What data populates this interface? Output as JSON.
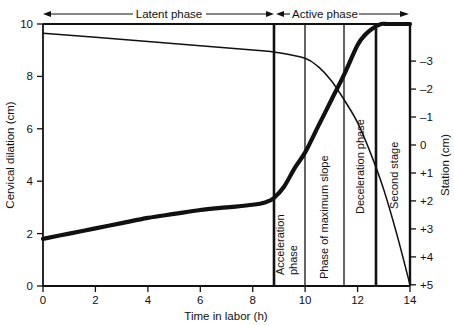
{
  "chart_data": {
    "type": "line",
    "title": "",
    "xlabel": "Time in labor (h)",
    "ylabel": "Cervical dilation (cm)",
    "y2label": "Station (cm)",
    "xlim": [
      0,
      14
    ],
    "ylim": [
      0,
      10
    ],
    "y2lim": [
      -4,
      5
    ],
    "grid": false,
    "legend_position": "none",
    "xticks": [
      "0",
      "2",
      "4",
      "6",
      "8",
      "10",
      "12",
      "14"
    ],
    "xtick_values": [
      0,
      2,
      4,
      6,
      8,
      10,
      12,
      14
    ],
    "yticks": [
      "0",
      "2",
      "4",
      "6",
      "8",
      "10"
    ],
    "ytick_values": [
      0,
      2,
      4,
      6,
      8,
      10
    ],
    "y2ticks": [
      "–3",
      "–2",
      "–1",
      "0",
      "+1",
      "+2",
      "+3",
      "+4",
      "+5"
    ],
    "y2tick_values": [
      -3,
      -2,
      -1,
      0,
      1,
      2,
      3,
      4,
      5
    ],
    "series": [
      {
        "name": "Cervical dilation",
        "axis": "left",
        "style": "thick",
        "x": [
          0,
          1,
          2,
          3,
          4,
          5,
          6,
          7,
          8,
          8.5,
          8.8,
          9.2,
          9.6,
          10,
          10.5,
          11,
          11.5,
          12,
          12.3,
          12.6,
          12.9,
          13.2,
          14
        ],
        "values": [
          1.8,
          2.0,
          2.2,
          2.4,
          2.6,
          2.75,
          2.9,
          3.0,
          3.1,
          3.2,
          3.35,
          3.8,
          4.5,
          5.1,
          6.1,
          7.1,
          8.1,
          9.2,
          9.6,
          9.85,
          10.0,
          10.0,
          10.0
        ]
      },
      {
        "name": "Station",
        "axis": "right",
        "style": "thin",
        "x": [
          0,
          2,
          4,
          6,
          8,
          9,
          10,
          10.5,
          11,
          11.5,
          12,
          12.5,
          13,
          13.5,
          14
        ],
        "values": [
          -4.0,
          -3.85,
          -3.7,
          -3.55,
          -3.4,
          -3.3,
          -3.1,
          -2.8,
          -2.3,
          -1.6,
          -0.8,
          0.3,
          1.6,
          3.2,
          5.0
        ]
      }
    ],
    "phase_dividers": [
      8.8,
      10.0,
      11.5,
      12.7
    ],
    "annotations": [
      {
        "name": "latent-phase",
        "label": "Latent phase",
        "from": 0,
        "to": 8.8,
        "position": "top"
      },
      {
        "name": "active-phase",
        "label": "Active phase",
        "from": 8.8,
        "to": 14,
        "position": "top"
      },
      {
        "name": "acceleration-phase",
        "label": "Acceleration phase",
        "from": 8.8,
        "to": 10.0,
        "position": "inside-vertical"
      },
      {
        "name": "phase-of-maximum-slope",
        "label": "Phase of maximum slope",
        "from": 10.0,
        "to": 11.5,
        "position": "inside-vertical"
      },
      {
        "name": "deceleration-phase",
        "label": "Deceleration phase",
        "from": 11.5,
        "to": 12.7,
        "position": "inside-vertical"
      },
      {
        "name": "second-stage",
        "label": "Second stage",
        "from": 12.7,
        "to": 14,
        "position": "inside-vertical"
      }
    ]
  },
  "axes": {
    "x_label": "Time in labor (h)",
    "y_left_label": "Cervical dilation (cm)",
    "y_right_label": "Station (cm)"
  },
  "phases": {
    "latent": "Latent phase",
    "active": "Active phase",
    "acceleration_line1": "Acceleration",
    "acceleration_line2": "phase",
    "max_slope": "Phase of maximum slope",
    "deceleration": "Deceleration phase",
    "second_stage": "Second stage"
  },
  "ticks": {
    "x": [
      "0",
      "2",
      "4",
      "6",
      "8",
      "10",
      "12",
      "14"
    ],
    "y_left": [
      "0",
      "2",
      "4",
      "6",
      "8",
      "10"
    ],
    "y_right": [
      "–3",
      "–2",
      "–1",
      "0",
      "+1",
      "+2",
      "+3",
      "+4",
      "+5"
    ]
  },
  "colors": {
    "ink": "#111111",
    "background": "#ffffff"
  }
}
